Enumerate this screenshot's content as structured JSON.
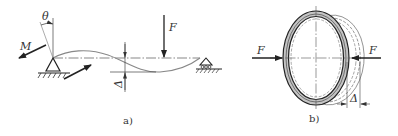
{
  "figure_a": {
    "caption": "a)",
    "labels": {
      "theta": "θ",
      "moment": "M",
      "force": "F",
      "delta": "Δ"
    },
    "elements": [
      "pinned-support",
      "roller-support",
      "deflected-beam-curve",
      "beam-centerline",
      "applied-force",
      "applied-moment",
      "deflection-dimension",
      "rotation-angle"
    ]
  },
  "figure_b": {
    "caption": "b)",
    "labels": {
      "force_left": "F",
      "force_right": "F",
      "delta": "Δ"
    },
    "elements": [
      "ring-cross-section",
      "deformed-ring-outline",
      "compressive-forces",
      "horizontal-deformation-dimension"
    ]
  },
  "colors": {
    "line": "#333333",
    "curve": "#888888",
    "ring_fill": "#bbbbbb"
  }
}
